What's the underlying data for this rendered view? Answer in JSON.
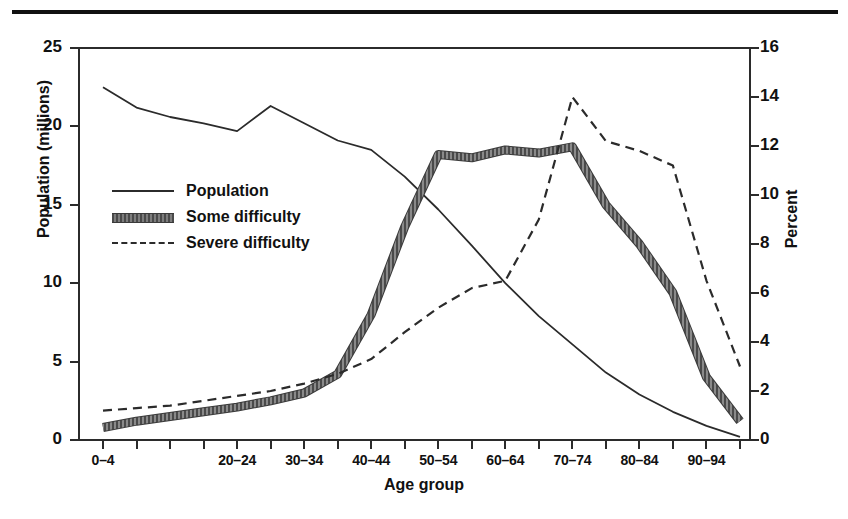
{
  "figure": {
    "title_partial": "",
    "background": "#ffffff",
    "ink_color": "#2b2b2b"
  },
  "axis_titles": {
    "left": "Population (millions)",
    "right": "Percent",
    "bottom": "Age group"
  },
  "legend": {
    "items": [
      {
        "label": "Population",
        "style": "solid-thin",
        "axis": "left"
      },
      {
        "label": "Some difficulty",
        "style": "thick-textured",
        "axis": "left"
      },
      {
        "label": "Severe difficulty",
        "style": "dashed",
        "axis": "right"
      }
    ]
  },
  "chart_data": {
    "type": "line",
    "title": "",
    "xlabel": "Age group",
    "ylabel": "Population (millions)",
    "y2label": "Percent",
    "grid": false,
    "legend_position": "inside-left",
    "ylim": [
      0,
      25
    ],
    "y2lim": [
      0,
      16
    ],
    "yticks": [
      0,
      5,
      10,
      15,
      20,
      25
    ],
    "y2ticks": [
      0,
      2,
      4,
      6,
      8,
      10,
      12,
      14,
      16
    ],
    "categories": [
      "0-4",
      "5-9",
      "10-14",
      "15-19",
      "20-24",
      "25-29",
      "30-34",
      "35-39",
      "40-44",
      "45-49",
      "50-54",
      "55-59",
      "60-64",
      "65-69",
      "70-74",
      "75-79",
      "80-84",
      "85-89",
      "90-94",
      "95+"
    ],
    "xtick_labels": [
      "0-4",
      "20-24",
      "30-34",
      "40-44",
      "50-54",
      "60-64",
      "70-74",
      "80-84",
      "90-94"
    ],
    "xtick_categories": [
      "0-4",
      "20-24",
      "30-34",
      "40-44",
      "50-54",
      "60-64",
      "70-74",
      "80-84",
      "90-94"
    ],
    "series": [
      {
        "name": "Population",
        "axis": "left",
        "unit": "millions",
        "values": [
          22.5,
          21.2,
          20.6,
          20.2,
          19.7,
          21.3,
          20.2,
          19.1,
          18.5,
          16.8,
          14.7,
          12.4,
          10.0,
          7.9,
          6.1,
          4.3,
          2.9,
          1.8,
          0.9,
          0.2
        ]
      },
      {
        "name": "Some difficulty",
        "axis": "left",
        "unit": "millions",
        "values": [
          0.8,
          1.2,
          1.5,
          1.8,
          2.1,
          2.5,
          3.0,
          4.2,
          8.0,
          13.6,
          18.2,
          18.0,
          18.5,
          18.3,
          18.7,
          15.0,
          12.5,
          9.4,
          4.0,
          1.2
        ]
      },
      {
        "name": "Severe difficulty",
        "axis": "right",
        "unit": "percent",
        "values": [
          1.2,
          1.3,
          1.4,
          1.6,
          1.8,
          2.0,
          2.3,
          2.7,
          3.3,
          4.4,
          5.4,
          6.2,
          6.5,
          9.0,
          14.0,
          12.2,
          11.8,
          11.2,
          6.5,
          3.0
        ]
      }
    ],
    "annotations": []
  }
}
